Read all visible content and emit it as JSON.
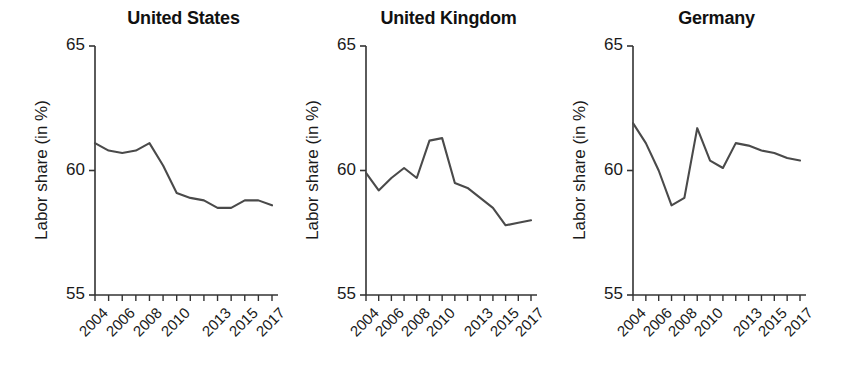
{
  "figure": {
    "background": "#ffffff",
    "line_color": "#4a4a4a",
    "axis_color": "#333333",
    "text_color": "#1a1a1a"
  },
  "axis": {
    "ylabel": "Labor share (in %)",
    "yticks": [
      "65",
      "60",
      "55"
    ],
    "xticks_labeled": [
      "2004",
      "2006",
      "2008",
      "2010",
      "2013",
      "2015",
      "2017"
    ]
  },
  "chart_data": {
    "type": "line",
    "title": "",
    "xlabel": "",
    "ylabel": "Labor share (in %)",
    "ylim": [
      55,
      65
    ],
    "yticks": [
      55,
      60,
      65
    ],
    "grid": false,
    "legend": "none",
    "x": [
      2004,
      2005,
      2006,
      2007,
      2008,
      2009,
      2010,
      2011,
      2012,
      2013,
      2014,
      2015,
      2016,
      2017
    ],
    "xtick_labels": [
      "2004",
      "",
      "2006",
      "",
      "2008",
      "",
      "2010",
      "",
      "",
      "2013",
      "",
      "2015",
      "",
      "2017"
    ],
    "panels": [
      {
        "title": "United States",
        "series": [
          {
            "name": "United States",
            "values": [
              61.1,
              60.8,
              60.7,
              60.8,
              61.1,
              60.2,
              59.1,
              58.9,
              58.8,
              58.5,
              58.5,
              58.8,
              58.8,
              58.6
            ]
          }
        ]
      },
      {
        "title": "United Kingdom",
        "series": [
          {
            "name": "United Kingdom",
            "values": [
              59.9,
              59.2,
              59.7,
              60.1,
              59.7,
              61.2,
              61.3,
              59.5,
              59.3,
              58.9,
              58.5,
              57.8,
              57.9,
              58.0
            ]
          }
        ]
      },
      {
        "title": "Germany",
        "series": [
          {
            "name": "Germany",
            "values": [
              61.9,
              61.1,
              60.0,
              58.6,
              58.9,
              61.7,
              60.4,
              60.1,
              61.1,
              61.0,
              60.8,
              60.7,
              60.5,
              60.4
            ]
          }
        ]
      }
    ]
  }
}
